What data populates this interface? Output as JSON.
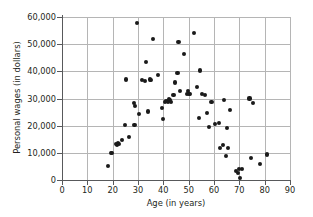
{
  "chart_data": {
    "type": "scatter",
    "title": "",
    "xlabel": "Age (in years)",
    "ylabel": "Personal wages (in dollars)",
    "xlim": [
      0,
      90
    ],
    "ylim": [
      0,
      60000
    ],
    "xticks": [
      "0",
      "10",
      "20",
      "30",
      "40",
      "50",
      "60",
      "70",
      "80",
      "90"
    ],
    "xtick_values": [
      0,
      10,
      20,
      30,
      40,
      50,
      60,
      70,
      80,
      90
    ],
    "yticks": [
      "0",
      "10,000",
      "20,000",
      "30,000",
      "40,000",
      "50,000",
      "60,000"
    ],
    "ytick_values": [
      0,
      10000,
      20000,
      30000,
      40000,
      50000,
      60000
    ],
    "grid": true,
    "grid_color": "#b5b5b5",
    "axis_color": "#58595b",
    "marker_color": "#1a1a1a",
    "background": "#ffffff",
    "legend": null,
    "points": [
      [
        18.0,
        5000
      ],
      [
        19.3,
        9900
      ],
      [
        19.9,
        10000
      ],
      [
        21.3,
        13300
      ],
      [
        21.6,
        12900
      ],
      [
        22.0,
        13600
      ],
      [
        22.6,
        13300
      ],
      [
        23.6,
        14600
      ],
      [
        25.0,
        20200
      ],
      [
        25.2,
        37000
      ],
      [
        26.3,
        15800
      ],
      [
        28.3,
        28200
      ],
      [
        28.6,
        20300
      ],
      [
        28.8,
        27200
      ],
      [
        29.5,
        57800
      ],
      [
        30.3,
        24200
      ],
      [
        31.7,
        36700
      ],
      [
        32.6,
        36600
      ],
      [
        33.3,
        43500
      ],
      [
        34.0,
        25200
      ],
      [
        34.6,
        37000
      ],
      [
        35.2,
        36800
      ],
      [
        36.0,
        51800
      ],
      [
        37.8,
        38500
      ],
      [
        39.6,
        26600
      ],
      [
        40.0,
        22400
      ],
      [
        40.6,
        28700
      ],
      [
        41.0,
        29000
      ],
      [
        41.8,
        28900
      ],
      [
        42.3,
        29900
      ],
      [
        42.6,
        29300
      ],
      [
        43.2,
        28800
      ],
      [
        44.0,
        31200
      ],
      [
        44.5,
        35900
      ],
      [
        45.6,
        39400
      ],
      [
        46.0,
        50700
      ],
      [
        46.6,
        32600
      ],
      [
        48.0,
        46400
      ],
      [
        49.3,
        31700
      ],
      [
        49.9,
        32700
      ],
      [
        50.2,
        31600
      ],
      [
        50.6,
        31700
      ],
      [
        52.0,
        54200
      ],
      [
        53.3,
        34300
      ],
      [
        54.0,
        22800
      ],
      [
        54.6,
        40300
      ],
      [
        55.3,
        31700
      ],
      [
        56.6,
        31300
      ],
      [
        57.3,
        24700
      ],
      [
        58.0,
        19400
      ],
      [
        59.0,
        28600
      ],
      [
        60.3,
        20600
      ],
      [
        62.0,
        21000
      ],
      [
        62.3,
        11700
      ],
      [
        63.6,
        12800
      ],
      [
        64.0,
        29400
      ],
      [
        64.6,
        9000
      ],
      [
        65.0,
        19000
      ],
      [
        65.6,
        11700
      ],
      [
        66.3,
        25700
      ],
      [
        68.8,
        3400
      ],
      [
        69.6,
        2500
      ],
      [
        70.0,
        4000
      ],
      [
        70.3,
        800
      ],
      [
        71.0,
        4000
      ],
      [
        74.0,
        30000
      ],
      [
        74.5,
        8000
      ],
      [
        75.3,
        28400
      ],
      [
        78.0,
        6000
      ],
      [
        81.0,
        9400
      ]
    ]
  }
}
